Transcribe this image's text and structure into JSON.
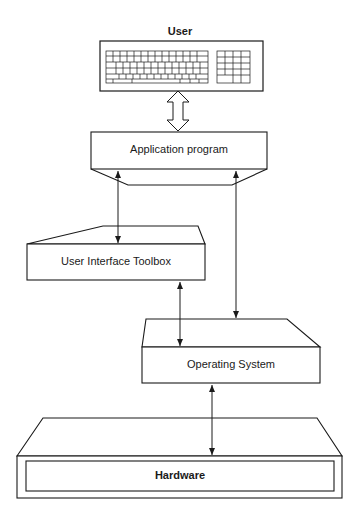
{
  "diagram": {
    "nodes": {
      "user": {
        "label": "User"
      },
      "application": {
        "label": "Application program"
      },
      "toolbox": {
        "label": "User Interface Toolbox"
      },
      "os": {
        "label": "Operating System"
      },
      "hardware": {
        "label": "Hardware"
      }
    },
    "edges": [
      {
        "from": "user",
        "to": "application",
        "style": "hollow-double-arrow"
      },
      {
        "from": "application",
        "to": "toolbox",
        "style": "double-arrow"
      },
      {
        "from": "application",
        "to": "os",
        "style": "double-arrow"
      },
      {
        "from": "toolbox",
        "to": "os",
        "style": "double-arrow"
      },
      {
        "from": "os",
        "to": "hardware",
        "style": "double-arrow"
      }
    ],
    "icons": {
      "user_device": "keyboard-icon"
    },
    "colors": {
      "line": "#1a1a1a",
      "fill": "#ffffff"
    }
  }
}
